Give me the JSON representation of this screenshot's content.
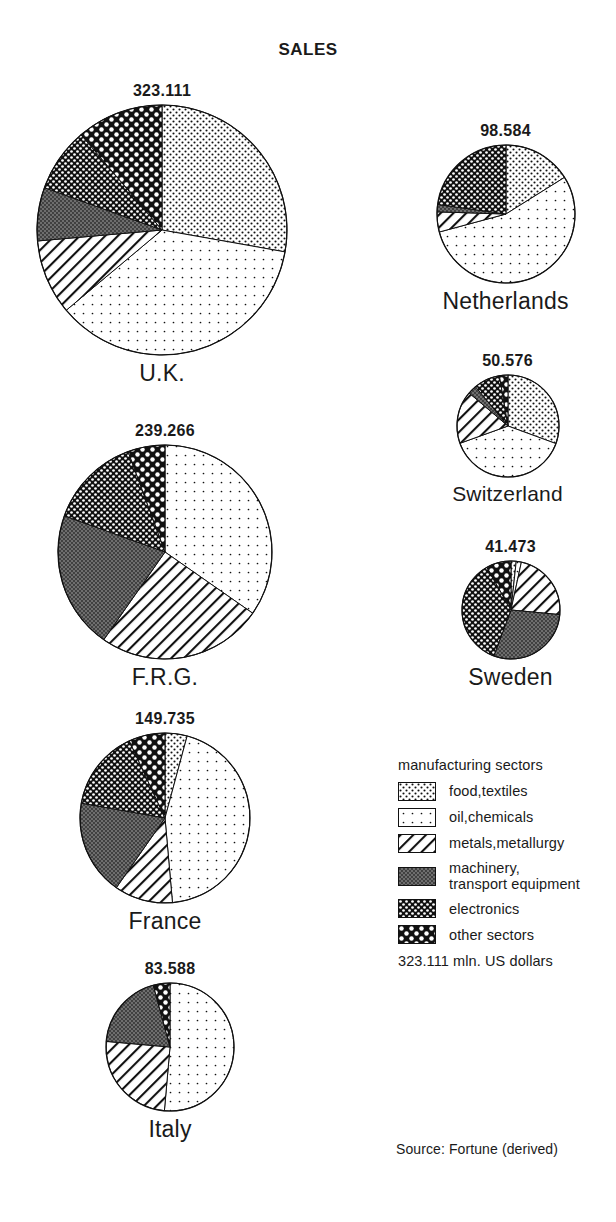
{
  "title": "SALES",
  "source": "Source: Fortune (derived)",
  "legend": {
    "title": "manufacturing sectors",
    "unit_note": "323.111 mln. US dollars",
    "items": [
      {
        "key": "food",
        "label": "food,textiles"
      },
      {
        "key": "oil",
        "label": "oil,chemicals"
      },
      {
        "key": "metals",
        "label": "metals,metallurgy"
      },
      {
        "key": "machinery",
        "label": "machinery,\ntransport equipment"
      },
      {
        "key": "electronics",
        "label": "electronics"
      },
      {
        "key": "other",
        "label": "other sectors"
      }
    ]
  },
  "chart_data": {
    "type": "pie",
    "title": "SALES",
    "unit": "mln. US dollars",
    "legend_position": "bottom-right",
    "categories": [
      "food,textiles",
      "oil,chemicals",
      "metals,metallurgy",
      "machinery, transport equipment",
      "electronics",
      "other sectors"
    ],
    "note": "Each pie is area-scaled to its total; slices are percent shares read clockwise from 12 o'clock.",
    "pies": [
      {
        "name": "U.K.",
        "total": 323.111,
        "total_label": "323.111",
        "radius_px": 125,
        "shares": [
          27.8,
          36.1,
          9.7,
          6.9,
          8.3,
          11.2
        ],
        "slices": [
          {
            "sector": "food,textiles",
            "percent": 27.8,
            "value": 89.8
          },
          {
            "sector": "oil,chemicals",
            "percent": 36.1,
            "value": 116.6
          },
          {
            "sector": "metals,metallurgy",
            "percent": 9.7,
            "value": 31.4
          },
          {
            "sector": "machinery, transport equipment",
            "percent": 6.9,
            "value": 22.4
          },
          {
            "sector": "electronics",
            "percent": 8.3,
            "value": 26.9
          },
          {
            "sector": "other sectors",
            "percent": 11.2,
            "value": 36.0
          }
        ]
      },
      {
        "name": "F.R.G.",
        "total": 239.266,
        "total_label": "239.266",
        "radius_px": 107,
        "shares": [
          0.0,
          34.7,
          25.0,
          20.8,
          13.9,
          5.6
        ],
        "slices": [
          {
            "sector": "food,textiles",
            "percent": 0.0,
            "value": 0.0
          },
          {
            "sector": "oil,chemicals",
            "percent": 34.7,
            "value": 83.1
          },
          {
            "sector": "metals,metallurgy",
            "percent": 25.0,
            "value": 59.8
          },
          {
            "sector": "machinery, transport equipment",
            "percent": 20.8,
            "value": 49.8
          },
          {
            "sector": "electronics",
            "percent": 13.9,
            "value": 33.3
          },
          {
            "sector": "other sectors",
            "percent": 5.6,
            "value": 13.3
          }
        ]
      },
      {
        "name": "France",
        "total": 149.735,
        "total_label": "149.735",
        "radius_px": 85,
        "shares": [
          4.2,
          44.4,
          11.1,
          18.1,
          15.3,
          6.9
        ],
        "slices": [
          {
            "sector": "food,textiles",
            "percent": 4.2,
            "value": 6.2
          },
          {
            "sector": "oil,chemicals",
            "percent": 44.4,
            "value": 66.5
          },
          {
            "sector": "metals,metallurgy",
            "percent": 11.1,
            "value": 16.6
          },
          {
            "sector": "machinery, transport equipment",
            "percent": 18.1,
            "value": 27.1
          },
          {
            "sector": "electronics",
            "percent": 15.3,
            "value": 22.9
          },
          {
            "sector": "other sectors",
            "percent": 6.9,
            "value": 10.4
          }
        ]
      },
      {
        "name": "Italy",
        "total": 83.588,
        "total_label": "83.588",
        "radius_px": 64,
        "shares": [
          0.0,
          51.4,
          25.0,
          19.4,
          0.0,
          4.2
        ],
        "slices": [
          {
            "sector": "food,textiles",
            "percent": 0.0,
            "value": 0.0
          },
          {
            "sector": "oil,chemicals",
            "percent": 51.4,
            "value": 43.0
          },
          {
            "sector": "metals,metallurgy",
            "percent": 25.0,
            "value": 20.9
          },
          {
            "sector": "machinery, transport equipment",
            "percent": 19.4,
            "value": 16.2
          },
          {
            "sector": "electronics",
            "percent": 0.0,
            "value": 0.0
          },
          {
            "sector": "other sectors",
            "percent": 4.2,
            "value": 3.5
          }
        ]
      },
      {
        "name": "Netherlands",
        "total": 98.584,
        "total_label": "98.584",
        "radius_px": 69,
        "shares": [
          16.1,
          54.7,
          4.7,
          1.7,
          22.8,
          0.0
        ],
        "slices": [
          {
            "sector": "food,textiles",
            "percent": 16.1,
            "value": 15.9
          },
          {
            "sector": "oil,chemicals",
            "percent": 54.7,
            "value": 53.9
          },
          {
            "sector": "metals,metallurgy",
            "percent": 4.7,
            "value": 4.6
          },
          {
            "sector": "machinery, transport equipment",
            "percent": 1.7,
            "value": 1.7
          },
          {
            "sector": "electronics",
            "percent": 22.8,
            "value": 22.5
          },
          {
            "sector": "other sectors",
            "percent": 0.0,
            "value": 0.0
          }
        ]
      },
      {
        "name": "Switzerland",
        "total": 50.576,
        "total_label": "50.576",
        "radius_px": 51,
        "shares": [
          30.6,
          38.9,
          16.7,
          2.8,
          8.3,
          2.7
        ],
        "slices": [
          {
            "sector": "food,textiles",
            "percent": 30.6,
            "value": 15.5
          },
          {
            "sector": "oil,chemicals",
            "percent": 38.9,
            "value": 19.7
          },
          {
            "sector": "metals,metallurgy",
            "percent": 16.7,
            "value": 8.4
          },
          {
            "sector": "machinery, transport equipment",
            "percent": 2.8,
            "value": 1.4
          },
          {
            "sector": "electronics",
            "percent": 8.3,
            "value": 4.2
          },
          {
            "sector": "other sectors",
            "percent": 2.7,
            "value": 1.4
          }
        ]
      },
      {
        "name": "Sweden",
        "total": 41.473,
        "total_label": "41.473",
        "radius_px": 49,
        "shares": [
          1.7,
          1.7,
          23.1,
          29.2,
          36.1,
          8.2
        ],
        "slices": [
          {
            "sector": "food,textiles",
            "percent": 1.7,
            "value": 0.7
          },
          {
            "sector": "oil,chemicals",
            "percent": 1.7,
            "value": 0.7
          },
          {
            "sector": "metals,metallurgy",
            "percent": 23.1,
            "value": 9.6
          },
          {
            "sector": "machinery, transport equipment",
            "percent": 29.2,
            "value": 12.1
          },
          {
            "sector": "electronics",
            "percent": 36.1,
            "value": 15.0
          },
          {
            "sector": "other sectors",
            "percent": 8.2,
            "value": 3.4
          }
        ]
      }
    ]
  },
  "pie_positions": {
    "U.K.": {
      "left": 12,
      "top": 82,
      "width": 300,
      "label_size": "big"
    },
    "F.R.G.": {
      "left": 30,
      "top": 422,
      "width": 270,
      "label_size": "big"
    },
    "France": {
      "left": 50,
      "top": 710,
      "width": 230,
      "label_size": "big"
    },
    "Italy": {
      "left": 80,
      "top": 960,
      "width": 180,
      "label_size": "big"
    },
    "Netherlands": {
      "left": 408,
      "top": 122,
      "width": 195,
      "label_size": "big"
    },
    "Switzerland": {
      "left": 420,
      "top": 352,
      "width": 175,
      "label_size": "small"
    },
    "Sweden": {
      "left": 428,
      "top": 538,
      "width": 165,
      "label_size": "big"
    }
  },
  "colors": {
    "ink": "#111111",
    "background": "#ffffff",
    "machinery_fill": "#6e6e6e"
  }
}
